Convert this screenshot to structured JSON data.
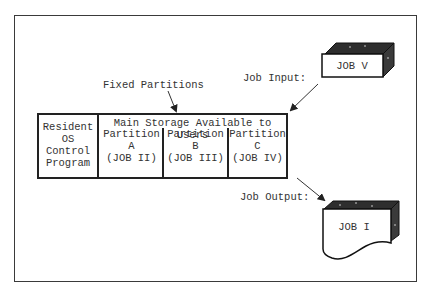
{
  "diagram": {
    "fixed_partitions_label": "Fixed Partitions",
    "job_input_label": "Job Input:",
    "job_output_label": "Job Output:",
    "memory_table": {
      "os_cell": [
        "Resident",
        "OS",
        "Control",
        "Program"
      ],
      "user_area_header": "Main Storage Available to Users",
      "partitions": [
        {
          "title": "Partition",
          "id": "A",
          "job": "(JOB II)"
        },
        {
          "title": "Partition",
          "id": "B",
          "job": "(JOB III)"
        },
        {
          "title": "Partition",
          "id": "C",
          "job": "(JOB IV)"
        }
      ]
    },
    "input_job": "JOB V",
    "output_job": "JOB I"
  }
}
